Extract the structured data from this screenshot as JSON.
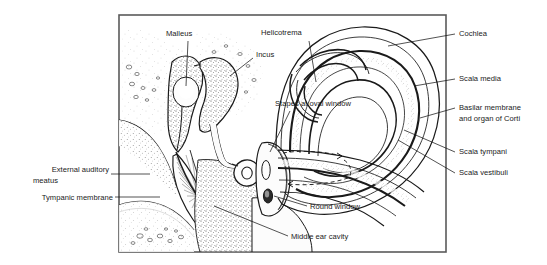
{
  "figure": {
    "frame_color": "#5a5a5a",
    "ink_color": "#1a1a1a",
    "background_color": "#ffffff",
    "label_color": "#1a1a1a"
  },
  "labels": {
    "malleus": "Malleus",
    "incus": "Incus",
    "helicotrema": "Helicotrema",
    "stapes_at_oval_window": "Stapes at oval window",
    "cochlea": "Cochlea",
    "scala_media": "Scala media",
    "basilar_membrane_line1": "Basilar membrane",
    "basilar_membrane_line2": "and organ of Corti",
    "scala_tympani": "Scala tympani",
    "scala_vestibuli": "Scala vestibuli",
    "round_window": "Round window",
    "middle_ear_cavity": "Middle ear cavity",
    "external_auditory_meatus_line1": "External auditory",
    "external_auditory_meatus_line2": "meatus",
    "tympanic_membrane": "Tympanic membrane"
  },
  "structures": [
    {
      "name": "malleus",
      "region": "middle-ear-ossicle"
    },
    {
      "name": "incus",
      "region": "middle-ear-ossicle"
    },
    {
      "name": "stapes",
      "region": "middle-ear-ossicle"
    },
    {
      "name": "tympanic-membrane",
      "region": "middle-ear"
    },
    {
      "name": "external-auditory-meatus",
      "region": "outer-ear"
    },
    {
      "name": "middle-ear-cavity",
      "region": "middle-ear"
    },
    {
      "name": "oval-window",
      "region": "inner-ear-interface"
    },
    {
      "name": "round-window",
      "region": "inner-ear-interface"
    },
    {
      "name": "cochlea",
      "region": "inner-ear"
    },
    {
      "name": "helicotrema",
      "region": "inner-ear"
    },
    {
      "name": "scala-vestibuli",
      "region": "cochlear-duct"
    },
    {
      "name": "scala-media",
      "region": "cochlear-duct"
    },
    {
      "name": "scala-tympani",
      "region": "cochlear-duct"
    },
    {
      "name": "basilar-membrane",
      "region": "cochlear-duct"
    }
  ]
}
